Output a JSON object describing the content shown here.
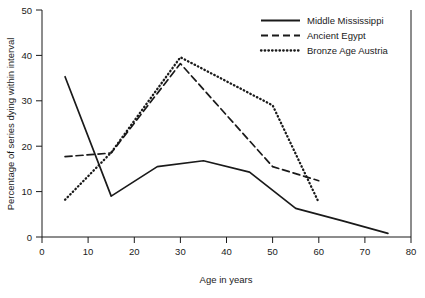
{
  "chart_data": {
    "type": "line",
    "title": "",
    "subtitle": "",
    "xlabel": "Age in years",
    "ylabel": "Percentage of series dying within interval",
    "xlim": [
      0,
      80
    ],
    "ylim": [
      0,
      50
    ],
    "xticks": [
      "0",
      "10",
      "20",
      "30",
      "40",
      "50",
      "60",
      "70",
      "80"
    ],
    "yticks": [
      "0",
      "10",
      "20",
      "30",
      "40",
      "50"
    ],
    "grid": false,
    "legend_position": "top-right",
    "x": [
      5,
      15,
      25,
      30,
      35,
      45,
      50,
      55,
      60,
      75
    ],
    "series": [
      {
        "name": "Middle Mississippi",
        "style": "solid",
        "color": "#1a1a1a",
        "x": [
          5,
          15,
          25,
          35,
          45,
          55,
          65,
          75
        ],
        "values": [
          35.3,
          9.0,
          15.5,
          16.8,
          14.3,
          6.3,
          3.6,
          0.8
        ]
      },
      {
        "name": "Ancient Egypt",
        "style": "dashed",
        "color": "#1a1a1a",
        "x": [
          5,
          15,
          30,
          50,
          60
        ],
        "values": [
          17.7,
          18.5,
          38.2,
          15.5,
          12.4
        ]
      },
      {
        "name": "Bronze Age Austria",
        "style": "dotted",
        "color": "#1a1a1a",
        "x": [
          5,
          15,
          30,
          50,
          60
        ],
        "values": [
          8.2,
          18.6,
          39.6,
          29.0,
          7.6
        ]
      }
    ]
  },
  "axes": {
    "x_title": "Age in years",
    "y_title": "Percentage of series dying within interval",
    "x_ticks": [
      "0",
      "10",
      "20",
      "30",
      "40",
      "50",
      "60",
      "70",
      "80"
    ],
    "y_ticks": [
      "0",
      "10",
      "20",
      "30",
      "40",
      "50"
    ]
  },
  "legend": {
    "items": [
      {
        "label": "Middle Mississippi",
        "style": "solid"
      },
      {
        "label": "Ancient Egypt",
        "style": "dashed"
      },
      {
        "label": "Bronze Age Austria",
        "style": "dotted"
      }
    ]
  }
}
